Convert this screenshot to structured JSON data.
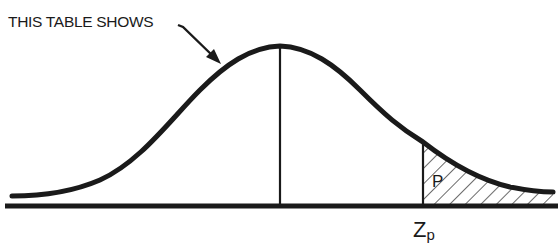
{
  "figure": {
    "type": "normal-distribution-upper-tail",
    "callout_text": "THIS TABLE SHOWS",
    "shaded_area_label": "P",
    "critical_value_label": {
      "main": "Z",
      "subscript": "p"
    },
    "colors": {
      "ink": "#1a1a1a",
      "background": "#ffffff"
    }
  }
}
